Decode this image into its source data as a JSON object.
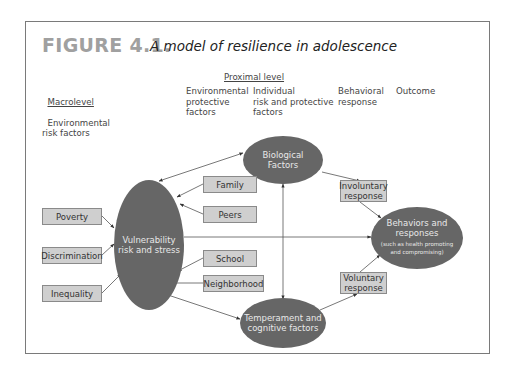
{
  "figure": {
    "label": "FIGURE 4.1.",
    "title": "A model of resilience in adolescence"
  },
  "headers": {
    "proximal": "Proximal level",
    "macrolevel": "Macrolevel",
    "macro_sub": "Environmental\nrisk factors",
    "env_protective": "Environmental\nprotective\nfactors",
    "individual": "Individual\nrisk and protective\nfactors",
    "behavioral": "Behavioral\nresponse",
    "outcome": "Outcome"
  },
  "nodes": {
    "macro_factors": [
      "Poverty",
      "Discrimination",
      "Inequality"
    ],
    "vulnerability": "Vulnerability\nrisk and stress",
    "protective_factors": [
      "Family",
      "Peers",
      "School",
      "Neighborhood"
    ],
    "biological": "Biological\nFactors",
    "temperament": "Temperament and\ncognitive factors",
    "involuntary": "Involuntary\nresponse",
    "voluntary": "Voluntary\nresponse",
    "outcome_main": "Behaviors and\nresponses",
    "outcome_sub": "(such as health promoting\nand compromising)"
  },
  "colors": {
    "ellipse_fill": "#666666",
    "box_fill": "#cfcfcf",
    "box_border": "#8a8a8a",
    "line": "#555555",
    "label_gray": "#a0a0a0"
  }
}
